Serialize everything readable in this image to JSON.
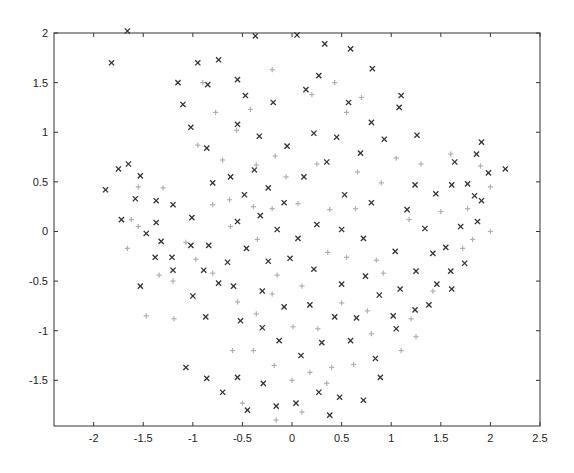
{
  "chart_data": {
    "type": "scatter",
    "title": "",
    "xlabel": "",
    "ylabel": "",
    "xlim": [
      -2.4,
      2.5
    ],
    "ylim": [
      -1.96,
      2.0
    ],
    "grid": false,
    "legend": null,
    "x_ticks": [
      "-2",
      "-1.5",
      "-1",
      "-0.5",
      "0",
      "0.5",
      "1",
      "1.5",
      "2",
      "2.5"
    ],
    "y_ticks": [
      "2",
      "1.5",
      "1",
      "0.5",
      "0",
      "-0.5",
      "-1",
      "-1.5"
    ],
    "series": [
      {
        "name": "class-x",
        "marker": "x",
        "color": "#333333",
        "points": [
          [
            -1.66,
            2.02
          ],
          [
            -1.82,
            1.7
          ],
          [
            -1.1,
            1.28
          ],
          [
            -0.95,
            1.7
          ],
          [
            -0.74,
            1.73
          ],
          [
            -0.37,
            1.97
          ],
          [
            0.05,
            1.98
          ],
          [
            0.33,
            1.89
          ],
          [
            0.59,
            1.84
          ],
          [
            0.81,
            1.64
          ],
          [
            1.1,
            1.37
          ],
          [
            -1.15,
            1.5
          ],
          [
            -0.85,
            1.48
          ],
          [
            -0.55,
            1.53
          ],
          [
            -0.47,
            1.37
          ],
          [
            -0.19,
            1.3
          ],
          [
            0.14,
            1.43
          ],
          [
            0.27,
            1.57
          ],
          [
            0.57,
            1.3
          ],
          [
            0.8,
            1.1
          ],
          [
            1.08,
            1.25
          ],
          [
            -1.02,
            1.05
          ],
          [
            -0.86,
            0.84
          ],
          [
            -0.55,
            1.08
          ],
          [
            -0.33,
            0.96
          ],
          [
            -0.05,
            0.86
          ],
          [
            0.22,
            0.99
          ],
          [
            0.45,
            0.95
          ],
          [
            0.69,
            0.79
          ],
          [
            0.93,
            0.93
          ],
          [
            1.26,
            0.97
          ],
          [
            -1.88,
            0.42
          ],
          [
            -1.75,
            0.63
          ],
          [
            -1.65,
            0.68
          ],
          [
            -1.53,
            0.56
          ],
          [
            -1.72,
            0.12
          ],
          [
            -1.58,
            0.33
          ],
          [
            -1.37,
            0.31
          ],
          [
            -1.2,
            0.27
          ],
          [
            -1.01,
            0.14
          ],
          [
            -1.47,
            -0.02
          ],
          [
            -1.37,
            0.09
          ],
          [
            -1.32,
            -0.1
          ],
          [
            -1.21,
            -0.26
          ],
          [
            -1.38,
            -0.26
          ],
          [
            -1.02,
            -0.14
          ],
          [
            -0.84,
            -0.14
          ],
          [
            -0.65,
            -0.31
          ],
          [
            -1.53,
            -0.55
          ],
          [
            -1.2,
            -0.39
          ],
          [
            -1.0,
            -0.65
          ],
          [
            -0.89,
            -0.39
          ],
          [
            -0.74,
            -0.52
          ],
          [
            -0.59,
            -0.55
          ],
          [
            -0.8,
            0.49
          ],
          [
            -0.62,
            0.55
          ],
          [
            -0.48,
            0.37
          ],
          [
            -0.38,
            0.62
          ],
          [
            -0.24,
            0.44
          ],
          [
            -0.08,
            0.29
          ],
          [
            0.12,
            0.55
          ],
          [
            0.35,
            0.7
          ],
          [
            0.53,
            0.37
          ],
          [
            0.8,
            0.29
          ],
          [
            -0.55,
            0.1
          ],
          [
            -0.32,
            0.16
          ],
          [
            -0.15,
            0.02
          ],
          [
            0.06,
            -0.07
          ],
          [
            0.25,
            0.07
          ],
          [
            0.5,
            0.02
          ],
          [
            0.72,
            -0.07
          ],
          [
            -0.46,
            -0.17
          ],
          [
            -0.24,
            -0.3
          ],
          [
            -0.02,
            -0.27
          ],
          [
            0.22,
            -0.38
          ],
          [
            0.5,
            -0.53
          ],
          [
            0.74,
            -0.45
          ],
          [
            1.04,
            -0.2
          ],
          [
            -0.3,
            -0.6
          ],
          [
            -0.08,
            -0.76
          ],
          [
            0.18,
            -0.74
          ],
          [
            0.43,
            -0.86
          ],
          [
            0.65,
            -0.87
          ],
          [
            0.88,
            -0.64
          ],
          [
            1.09,
            -0.58
          ],
          [
            -0.87,
            -0.86
          ],
          [
            -0.52,
            -0.9
          ],
          [
            -0.3,
            -0.97
          ],
          [
            -0.13,
            -1.1
          ],
          [
            0.09,
            -1.25
          ],
          [
            0.3,
            -1.12
          ],
          [
            0.59,
            -1.1
          ],
          [
            0.84,
            -1.28
          ],
          [
            -1.07,
            -1.37
          ],
          [
            -0.86,
            -1.48
          ],
          [
            -0.55,
            -1.47
          ],
          [
            -0.29,
            -1.53
          ],
          [
            0.27,
            -1.62
          ],
          [
            0.48,
            -1.67
          ],
          [
            0.72,
            -1.7
          ],
          [
            0.89,
            -1.47
          ],
          [
            -0.7,
            -1.62
          ],
          [
            -0.45,
            -1.8
          ],
          [
            -0.16,
            -1.76
          ],
          [
            0.04,
            -1.73
          ],
          [
            0.38,
            -1.85
          ],
          [
            1.16,
            0.22
          ],
          [
            1.24,
            0.47
          ],
          [
            1.34,
            0.03
          ],
          [
            1.42,
            -0.22
          ],
          [
            1.45,
            0.38
          ],
          [
            1.61,
            0.47
          ],
          [
            1.64,
            0.7
          ],
          [
            1.7,
            0.05
          ],
          [
            1.77,
            0.48
          ],
          [
            1.86,
            0.78
          ],
          [
            1.91,
            0.9
          ],
          [
            2.15,
            0.63
          ],
          [
            1.25,
            -0.4
          ],
          [
            1.46,
            -0.53
          ],
          [
            1.6,
            -0.4
          ],
          [
            1.74,
            -0.32
          ],
          [
            1.61,
            -0.58
          ],
          [
            1.84,
            0.36
          ],
          [
            1.98,
            0.59
          ],
          [
            1.91,
            0.31
          ],
          [
            1.87,
            0.1
          ],
          [
            1.55,
            -0.16
          ],
          [
            1.38,
            -0.74
          ],
          [
            1.24,
            -0.79
          ],
          [
            1.05,
            -0.98
          ],
          [
            1.02,
            -0.85
          ]
        ]
      },
      {
        "name": "class-plus",
        "marker": "+",
        "color": "#b0b0b0",
        "points": [
          [
            -1.55,
            0.45
          ],
          [
            -1.3,
            0.44
          ],
          [
            -1.62,
            0.12
          ],
          [
            -1.55,
            0.05
          ],
          [
            -1.66,
            -0.17
          ],
          [
            -1.2,
            -0.5
          ],
          [
            -0.97,
            -0.28
          ],
          [
            -1.34,
            -0.44
          ],
          [
            -1.47,
            -0.85
          ],
          [
            -1.19,
            -0.88
          ],
          [
            -0.9,
            1.5
          ],
          [
            -0.77,
            1.2
          ],
          [
            -0.56,
            1.02
          ],
          [
            -0.42,
            1.23
          ],
          [
            -0.2,
            1.63
          ],
          [
            0.2,
            1.38
          ],
          [
            0.43,
            1.5
          ],
          [
            0.55,
            1.2
          ],
          [
            0.7,
            1.35
          ],
          [
            -0.95,
            0.87
          ],
          [
            -0.7,
            0.72
          ],
          [
            -0.36,
            0.67
          ],
          [
            -0.17,
            0.76
          ],
          [
            -0.06,
            0.55
          ],
          [
            0.25,
            0.68
          ],
          [
            0.66,
            0.6
          ],
          [
            0.9,
            0.49
          ],
          [
            -0.8,
            0.27
          ],
          [
            -0.63,
            0.32
          ],
          [
            -0.39,
            0.25
          ],
          [
            -0.2,
            0.23
          ],
          [
            0.06,
            0.28
          ],
          [
            0.38,
            0.22
          ],
          [
            0.64,
            0.23
          ],
          [
            -1.07,
            -0.11
          ],
          [
            -0.8,
            -0.42
          ],
          [
            -0.62,
            0.05
          ],
          [
            -0.35,
            -0.08
          ],
          [
            -0.15,
            -0.44
          ],
          [
            0.1,
            -0.55
          ],
          [
            0.36,
            -0.21
          ],
          [
            0.55,
            -0.26
          ],
          [
            0.85,
            -0.29
          ],
          [
            -0.55,
            -0.71
          ],
          [
            -0.36,
            -0.83
          ],
          [
            -0.2,
            -0.63
          ],
          [
            0.01,
            -0.96
          ],
          [
            0.26,
            -0.98
          ],
          [
            0.5,
            -0.72
          ],
          [
            0.76,
            -0.8
          ],
          [
            1.2,
            -0.88
          ],
          [
            0.92,
            -0.42
          ],
          [
            1.42,
            -0.6
          ],
          [
            -0.6,
            -1.2
          ],
          [
            -0.39,
            -1.2
          ],
          [
            -0.18,
            -1.35
          ],
          [
            0.0,
            -1.5
          ],
          [
            0.18,
            -1.42
          ],
          [
            0.4,
            -1.37
          ],
          [
            0.62,
            -1.34
          ],
          [
            0.8,
            -1.03
          ],
          [
            1.1,
            -1.2
          ],
          [
            1.25,
            -1.06
          ],
          [
            -0.5,
            -1.73
          ],
          [
            -0.16,
            -1.9
          ],
          [
            0.1,
            -1.82
          ],
          [
            0.35,
            -1.53
          ],
          [
            1.3,
            0.68
          ],
          [
            1.5,
            0.2
          ],
          [
            1.6,
            0.78
          ],
          [
            1.9,
            0.66
          ],
          [
            2.0,
            0.45
          ],
          [
            1.77,
            0.23
          ],
          [
            1.82,
            -0.08
          ],
          [
            1.72,
            -0.17
          ],
          [
            2.0,
            0.0
          ],
          [
            1.18,
            0.12
          ],
          [
            1.05,
            0.74
          ]
        ]
      }
    ]
  }
}
